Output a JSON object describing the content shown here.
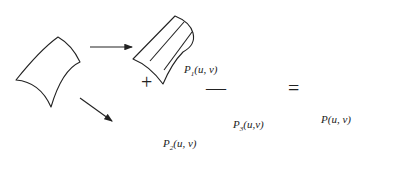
{
  "diagram": {
    "surfaces": [
      {
        "id": "input",
        "label": null
      },
      {
        "id": "p1",
        "label_base": "P",
        "label_sub": "1",
        "label_args": "(u, v)"
      },
      {
        "id": "p2",
        "label_base": "P",
        "label_sub": "2",
        "label_args": "(u, v)"
      },
      {
        "id": "p3",
        "label_base": "P",
        "label_sub": "3",
        "label_args": "(u,v)"
      },
      {
        "id": "result",
        "label_full": "P(u, v)"
      }
    ],
    "operators": {
      "plus": "+",
      "minus": "—",
      "equals": "="
    },
    "arrows": [
      {
        "from": "input",
        "to": "p1"
      },
      {
        "from": "input",
        "to": "p2"
      }
    ],
    "colors": {
      "stroke": "#222222",
      "background": "#ffffff"
    }
  }
}
